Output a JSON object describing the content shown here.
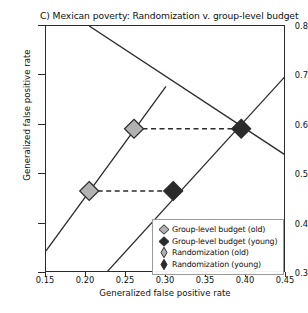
{
  "chart_data": {
    "type": "scatter",
    "title": "C) Mexican poverty: Randomization v. group-level budget",
    "xlabel": "Generalized false positive rate",
    "ylabel": "Generalized false positive rate",
    "xlim": [
      0.15,
      0.45
    ],
    "ylim": [
      0.3,
      0.8
    ],
    "xticks": [
      "0.15",
      "0.20",
      "0.25",
      "0.30",
      "0.35",
      "0.40",
      "0.45"
    ],
    "yticks": [
      "0.3",
      "0.4",
      "0.5",
      "0.6",
      "0.7",
      "0.8"
    ],
    "grid": false,
    "legend_position": "lower right",
    "series": [
      {
        "name": "Group-level budget (old)",
        "marker": "diamond-wide",
        "color": "#b2b2b2",
        "points": [
          {
            "x": 0.204,
            "y": 0.466
          },
          {
            "x": 0.26,
            "y": 0.592
          }
        ]
      },
      {
        "name": "Group-level budget (young)",
        "marker": "diamond-wide",
        "color": "#2b2b2b",
        "points": [
          {
            "x": 0.309,
            "y": 0.466
          },
          {
            "x": 0.394,
            "y": 0.592
          }
        ]
      },
      {
        "name": "Randomization (old)",
        "marker": "diamond-narrow",
        "color": "#b2b2b2",
        "points": []
      },
      {
        "name": "Randomization (young)",
        "marker": "diamond-narrow",
        "color": "#2b2b2b",
        "points": []
      }
    ],
    "connector_lines": [
      {
        "name": "old-pair-connector",
        "style": "dashed",
        "from": {
          "x": 0.204,
          "y": 0.466
        },
        "to": {
          "x": 0.309,
          "y": 0.466
        }
      },
      {
        "name": "young-pair-connector",
        "style": "dashed",
        "from": {
          "x": 0.26,
          "y": 0.592
        },
        "to": {
          "x": 0.394,
          "y": 0.592
        }
      }
    ],
    "frontier_lines": [
      {
        "name": "randomization-old-frontier",
        "style": "solid",
        "from": {
          "x": 0.15,
          "y": 0.345
        },
        "to": {
          "x": 0.3,
          "y": 0.678
        }
      },
      {
        "name": "randomization-young-frontier",
        "style": "solid",
        "from": {
          "x": 0.225,
          "y": 0.3
        },
        "to": {
          "x": 0.45,
          "y": 0.7
        }
      },
      {
        "name": "budget-frontier",
        "style": "solid",
        "from": {
          "x": 0.204,
          "y": 0.8
        },
        "to": {
          "x": 0.45,
          "y": 0.538
        }
      }
    ],
    "legend_entries": [
      {
        "label": "Group-level budget (old)",
        "marker": "diamond-wide",
        "color": "#b2b2b2"
      },
      {
        "label": "Group-level budget (young)",
        "marker": "diamond-wide",
        "color": "#2b2b2b"
      },
      {
        "label": "Randomization (old)",
        "marker": "diamond-narrow",
        "color": "#b2b2b2"
      },
      {
        "label": "Randomization (young)",
        "marker": "diamond-narrow",
        "color": "#2b2b2b"
      }
    ]
  }
}
